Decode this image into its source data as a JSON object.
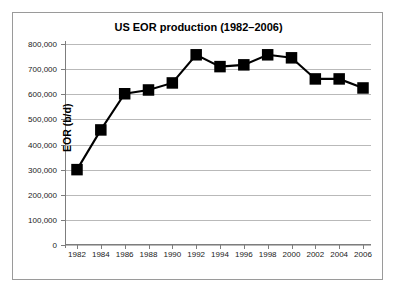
{
  "chart_data": {
    "type": "line",
    "title": "US EOR production (1982–2006)",
    "xlabel": "",
    "ylabel": "EOR (b/d)",
    "categories": [
      1982,
      1984,
      1986,
      1988,
      1990,
      1992,
      1994,
      1996,
      1998,
      2000,
      2002,
      2004,
      2006
    ],
    "values": [
      300000,
      458000,
      602000,
      617000,
      645000,
      757000,
      710000,
      717000,
      757000,
      745000,
      661000,
      661000,
      625000
    ],
    "x_tick_labels": [
      "1982",
      "1984",
      "1986",
      "1988",
      "1990",
      "1992",
      "1994",
      "1996",
      "1998",
      "2000",
      "2002",
      "2004",
      "2006"
    ],
    "y_tick_labels": [
      "800,000",
      "700,000",
      "600,000",
      "500,000",
      "400,000",
      "300,000",
      "200,000",
      "100,000",
      "0"
    ],
    "y_tick_values": [
      800000,
      700000,
      600000,
      500000,
      400000,
      300000,
      200000,
      100000,
      0
    ],
    "ylim": [
      0,
      800000
    ],
    "xlim": [
      1982,
      2006
    ],
    "grid": "horizontal",
    "legend": "none",
    "marker": "square",
    "series_color": "#000000",
    "gridline_color": "#b9b9b9",
    "axis_color": "#7d7d7d",
    "background_color": "#ffffff",
    "border_color": "#9a9a9a"
  }
}
